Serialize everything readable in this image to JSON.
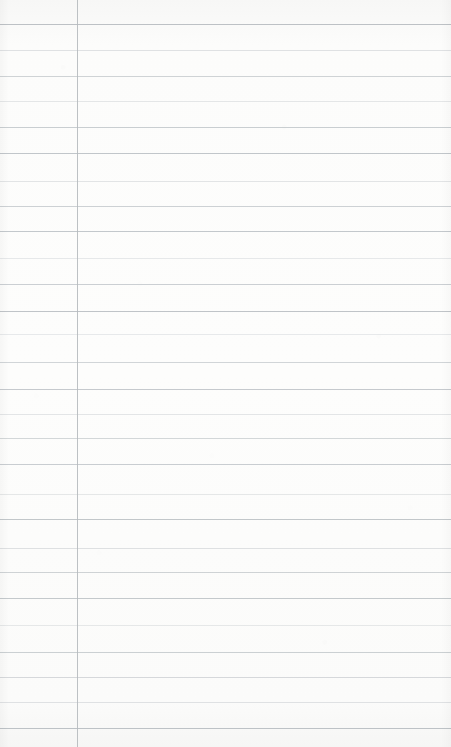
{
  "document": {
    "kind": "lined-notebook-paper",
    "title": "",
    "body_text": "",
    "is_blank": true,
    "width_px": 451,
    "height_px": 747
  },
  "paper": {
    "background_color": "#fbfbfa",
    "texture": "scanned-paper-grain",
    "rule_color": "#c6cacd",
    "margin_rule_color": "#b6babe"
  },
  "ruling": {
    "line_count": 28,
    "first_line_y": 24,
    "line_spacing_px": 25.3,
    "margin_rule_x": 77,
    "lines": [
      {
        "y": 24,
        "color": "#b9bec2",
        "opacity": 0.95,
        "thickness": 1
      },
      {
        "y": 50,
        "color": "#cdd1d4",
        "opacity": 0.62,
        "thickness": 1
      },
      {
        "y": 76,
        "color": "#c3c8cc",
        "opacity": 0.8,
        "thickness": 1
      },
      {
        "y": 101,
        "color": "#d0d4d7",
        "opacity": 0.55,
        "thickness": 1
      },
      {
        "y": 127,
        "color": "#c0c5c9",
        "opacity": 0.85,
        "thickness": 1
      },
      {
        "y": 153,
        "color": "#bcc1c5",
        "opacity": 0.92,
        "thickness": 1
      },
      {
        "y": 181,
        "color": "#cfd3d6",
        "opacity": 0.58,
        "thickness": 1
      },
      {
        "y": 206,
        "color": "#c2c7cb",
        "opacity": 0.82,
        "thickness": 1
      },
      {
        "y": 231,
        "color": "#bdc2c6",
        "opacity": 0.9,
        "thickness": 1
      },
      {
        "y": 258,
        "color": "#d1d5d8",
        "opacity": 0.52,
        "thickness": 1
      },
      {
        "y": 284,
        "color": "#c1c6ca",
        "opacity": 0.84,
        "thickness": 1
      },
      {
        "y": 311,
        "color": "#bbc0c4",
        "opacity": 0.93,
        "thickness": 1
      },
      {
        "y": 334,
        "color": "#d2d6d9",
        "opacity": 0.5,
        "thickness": 1
      },
      {
        "y": 362,
        "color": "#c4c9cd",
        "opacity": 0.78,
        "thickness": 1
      },
      {
        "y": 389,
        "color": "#bec3c7",
        "opacity": 0.88,
        "thickness": 1
      },
      {
        "y": 414,
        "color": "#cfd3d6",
        "opacity": 0.57,
        "thickness": 1
      },
      {
        "y": 438,
        "color": "#c5cacd",
        "opacity": 0.76,
        "thickness": 1
      },
      {
        "y": 464,
        "color": "#c0c5c9",
        "opacity": 0.86,
        "thickness": 1
      },
      {
        "y": 494,
        "color": "#d0d4d7",
        "opacity": 0.54,
        "thickness": 1
      },
      {
        "y": 519,
        "color": "#bcc1c5",
        "opacity": 0.91,
        "thickness": 1
      },
      {
        "y": 548,
        "color": "#ccd0d3",
        "opacity": 0.63,
        "thickness": 1
      },
      {
        "y": 572,
        "color": "#c3c8cc",
        "opacity": 0.8,
        "thickness": 1
      },
      {
        "y": 598,
        "color": "#bdc2c6",
        "opacity": 0.89,
        "thickness": 1
      },
      {
        "y": 625,
        "color": "#d1d5d8",
        "opacity": 0.53,
        "thickness": 1
      },
      {
        "y": 652,
        "color": "#c1c6ca",
        "opacity": 0.83,
        "thickness": 1
      },
      {
        "y": 677,
        "color": "#c7cbce",
        "opacity": 0.72,
        "thickness": 1
      },
      {
        "y": 702,
        "color": "#cdd1d4",
        "opacity": 0.6,
        "thickness": 1
      },
      {
        "y": 728,
        "color": "#b9bec2",
        "opacity": 0.94,
        "thickness": 1
      }
    ]
  }
}
